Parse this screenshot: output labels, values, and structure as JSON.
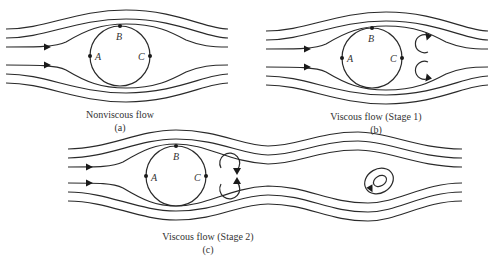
{
  "figure": {
    "panels": [
      {
        "id": "a",
        "caption": "Nonviscous flow",
        "sublabel": "(a)",
        "points": {
          "A": "A",
          "B": "B",
          "C": "C"
        },
        "vortices": "none"
      },
      {
        "id": "b",
        "caption": "Viscous flow (Stage 1)",
        "sublabel": "(b)",
        "points": {
          "A": "A",
          "B": "B",
          "C": "C"
        },
        "vortices": "pair of attached eddies behind cylinder"
      },
      {
        "id": "c",
        "caption": "Viscous flow (Stage 2)",
        "sublabel": "(c)",
        "points": {
          "A": "A",
          "B": "B",
          "C": "C"
        },
        "vortices": "attached eddy pair plus shed vortex downstream"
      }
    ],
    "colors": {
      "line": "#2a2a2a",
      "background": "#ffffff"
    }
  }
}
